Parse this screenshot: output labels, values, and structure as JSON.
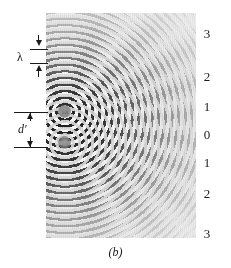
{
  "figure": {
    "caption": "(b)",
    "background_color": "#ffffff",
    "ink_color": "#1a1a1a"
  },
  "photograph": {
    "name": "ripple-tank-interference-photo",
    "base_tone": "#d8d8d8",
    "source_count": 2,
    "sources": [
      {
        "label": "upper-source",
        "disc_tone": "#969696"
      },
      {
        "label": "lower-source",
        "disc_tone": "#969696"
      }
    ]
  },
  "annotations": {
    "wavelength": {
      "symbol": "λ",
      "name": "wavelength",
      "arrow_upper": "arrow-down-icon",
      "arrow_lower": "arrow-up-icon"
    },
    "separation": {
      "symbol": "d′",
      "name": "source-separation",
      "arrow_upper": "arrow-up-icon",
      "arrow_lower": "arrow-down-icon"
    }
  },
  "order_labels": {
    "description": "interference maxima order numbers along the right edge",
    "items": [
      {
        "text": "3",
        "top": 14
      },
      {
        "text": "2",
        "top": 57
      },
      {
        "text": "1",
        "top": 87
      },
      {
        "text": "0",
        "top": 115
      },
      {
        "text": "1",
        "top": 143
      },
      {
        "text": "2",
        "top": 174
      },
      {
        "text": "3",
        "top": 214
      }
    ]
  },
  "chart_data": {
    "type": "heatmap",
    "title": "(b)",
    "subtitle": "Interference pattern of two coherent point sources in a ripple tank",
    "xlabel": "",
    "ylabel": "",
    "categories": [
      "3",
      "2",
      "1",
      "0",
      "1",
      "2",
      "3"
    ],
    "values": [
      3,
      2,
      1,
      0,
      1,
      2,
      3
    ],
    "legend": [
      "λ",
      "d′"
    ],
    "annotations": [
      "λ",
      "d′",
      "(b)"
    ],
    "grid": false,
    "legend_position": "left"
  }
}
